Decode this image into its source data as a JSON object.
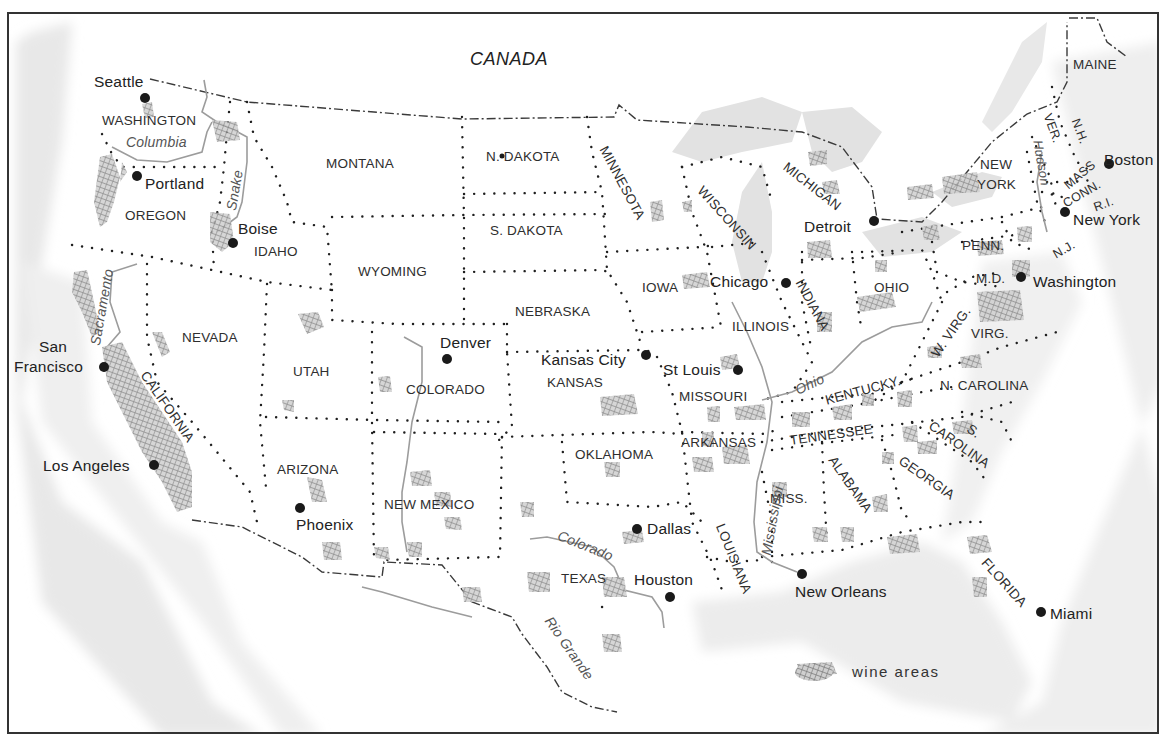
{
  "map": {
    "title_country": "CANADA",
    "colors": {
      "frame": "#333333",
      "border_dots": "#222222",
      "river": "#a8a8a8",
      "wine_hatch": "#8c8c8c",
      "sea_shade": "#e6e6e6",
      "city_dot": "#1a1a1a"
    },
    "states": [
      {
        "id": "washington",
        "label": "WASHINGTON"
      },
      {
        "id": "oregon",
        "label": "OREGON"
      },
      {
        "id": "idaho",
        "label": "IDAHO"
      },
      {
        "id": "montana",
        "label": "MONTANA"
      },
      {
        "id": "n-dakota",
        "label": "N. DAKOTA"
      },
      {
        "id": "s-dakota",
        "label": "S. DAKOTA"
      },
      {
        "id": "minnesota",
        "label": "MINNESOTA"
      },
      {
        "id": "wisconsin",
        "label": "WISCONSIN"
      },
      {
        "id": "michigan",
        "label": "MICHIGAN"
      },
      {
        "id": "new-york",
        "label_line1": "NEW",
        "label_line2": "YORK"
      },
      {
        "id": "maine",
        "label": "MAINE"
      },
      {
        "id": "vermont",
        "label": "VER."
      },
      {
        "id": "new-hampshire",
        "label": "N.H."
      },
      {
        "id": "massachusetts",
        "label": "MASS"
      },
      {
        "id": "connecticut",
        "label": "CONN."
      },
      {
        "id": "rhode-island",
        "label": "R.I."
      },
      {
        "id": "new-jersey",
        "label": "N.J."
      },
      {
        "id": "pennsylvania",
        "label": "PENN."
      },
      {
        "id": "maryland",
        "label": "M.D."
      },
      {
        "id": "wyoming",
        "label": "WYOMING"
      },
      {
        "id": "nebraska",
        "label": "NEBRASKA"
      },
      {
        "id": "iowa",
        "label": "IOWA"
      },
      {
        "id": "illinois",
        "label": "ILLINOIS"
      },
      {
        "id": "indiana",
        "label": "INDIANA"
      },
      {
        "id": "ohio",
        "label": "OHIO"
      },
      {
        "id": "west-virginia",
        "label": "W. VIRG."
      },
      {
        "id": "virginia",
        "label": "VIRG."
      },
      {
        "id": "nevada",
        "label": "NEVADA"
      },
      {
        "id": "utah",
        "label": "UTAH"
      },
      {
        "id": "colorado",
        "label": "COLORADO"
      },
      {
        "id": "kansas",
        "label": "KANSAS"
      },
      {
        "id": "missouri",
        "label": "MISSOURI"
      },
      {
        "id": "kentucky",
        "label": "KENTUCKY."
      },
      {
        "id": "n-carolina",
        "label": "N. CAROLINA"
      },
      {
        "id": "california",
        "label": "CALIFORNIA"
      },
      {
        "id": "arizona",
        "label": "ARIZONA"
      },
      {
        "id": "new-mexico",
        "label": "NEW MEXICO"
      },
      {
        "id": "oklahoma",
        "label": "OKLAHOMA"
      },
      {
        "id": "arkansas",
        "label": "ARKANSAS"
      },
      {
        "id": "tennessee",
        "label": "TENNESSEE"
      },
      {
        "id": "s-carolina-s",
        "label": "S."
      },
      {
        "id": "s-carolina",
        "label": "CAROLINA"
      },
      {
        "id": "mississippi-state",
        "label": "MISS."
      },
      {
        "id": "alabama",
        "label": "ALABAMA"
      },
      {
        "id": "georgia",
        "label": "GEORGIA"
      },
      {
        "id": "texas",
        "label": "TEXAS"
      },
      {
        "id": "louisiana",
        "label": "LOUISIANA"
      },
      {
        "id": "florida",
        "label": "FLORIDA"
      }
    ],
    "cities": [
      {
        "id": "seattle",
        "label": "Seattle"
      },
      {
        "id": "portland",
        "label": "Portland"
      },
      {
        "id": "boise",
        "label": "Boise"
      },
      {
        "id": "san-francisco",
        "label_line1": "San",
        "label_line2": "Francisco"
      },
      {
        "id": "los-angeles",
        "label": "Los Angeles"
      },
      {
        "id": "phoenix",
        "label": "Phoenix"
      },
      {
        "id": "denver",
        "label": "Denver"
      },
      {
        "id": "kansas-city",
        "label": "Kansas City"
      },
      {
        "id": "st-louis",
        "label": "St Louis"
      },
      {
        "id": "chicago",
        "label": "Chicago"
      },
      {
        "id": "detroit",
        "label": "Detroit"
      },
      {
        "id": "dallas",
        "label": "Dallas"
      },
      {
        "id": "houston",
        "label": "Houston"
      },
      {
        "id": "new-orleans",
        "label": "New Orleans"
      },
      {
        "id": "miami",
        "label": "Miami"
      },
      {
        "id": "washington-dc",
        "label": "Washington"
      },
      {
        "id": "new-york-city",
        "label": "New York"
      },
      {
        "id": "boston",
        "label": "Boston"
      }
    ],
    "rivers": [
      {
        "id": "columbia",
        "label": "Columbia"
      },
      {
        "id": "snake",
        "label": "Snake"
      },
      {
        "id": "sacramento",
        "label": "Sacramento"
      },
      {
        "id": "ohio-river",
        "label": "Ohio"
      },
      {
        "id": "mississippi",
        "label": "Mississippi"
      },
      {
        "id": "hudson",
        "label": "Hudson"
      },
      {
        "id": "colorado-river",
        "label": "Colorado"
      },
      {
        "id": "rio-grande",
        "label": "Rio Grande"
      }
    ],
    "legend": {
      "symbol": "wine-hatch",
      "label": "wine areas"
    }
  }
}
